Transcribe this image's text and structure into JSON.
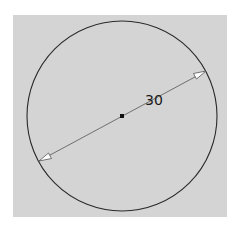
{
  "diagram": {
    "type": "cad-sketch",
    "shape": "circle",
    "center": {
      "x": 122,
      "y": 116
    },
    "radius_px": 95,
    "dimension": {
      "kind": "diameter",
      "value_label": "30",
      "start": {
        "x": 39,
        "y": 161
      },
      "end": {
        "x": 206,
        "y": 71
      }
    },
    "colors": {
      "background": "#d4d4d4",
      "stroke": "#2a2a2a",
      "dimension_line": "#555555",
      "arrow_fill": "#ffffff"
    }
  }
}
